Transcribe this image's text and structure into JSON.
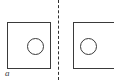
{
  "figure": {
    "type": "technical-drawing",
    "background_color": "#ffffff",
    "stroke_color": "#3a3a3a",
    "width": 114,
    "height": 80
  },
  "divider": {
    "name": "centerline",
    "style": "dashed",
    "orientation": "vertical",
    "color": "#2f2f2f",
    "x": 58
  },
  "parts": [
    {
      "id": "left",
      "shape": "rectangle-with-circular-hole",
      "label": "a",
      "rect": {
        "x": 7,
        "y": 22,
        "width": 44,
        "height": 47
      },
      "hole": {
        "cx": 35.5,
        "cy": 46.5,
        "r": 8.5
      }
    },
    {
      "id": "right",
      "shape": "rectangle-with-circular-hole",
      "label": "",
      "rect": {
        "x": 73,
        "y": 22,
        "width": 44,
        "height": 47
      },
      "hole": {
        "cx": 88.5,
        "cy": 46.5,
        "r": 8.5
      },
      "clipped": "right-edge"
    }
  ]
}
